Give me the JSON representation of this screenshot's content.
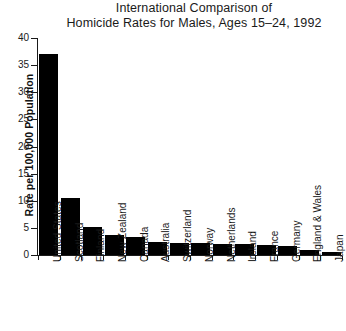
{
  "chart_data": {
    "type": "bar",
    "title": "International Comparison of Homicide Rates for Males, Ages 15–24, 1992",
    "title_lines": [
      "International Comparison of",
      "Homicide Rates for Males, Ages 15–24, 1992"
    ],
    "xlabel": "",
    "ylabel": "Rate per 100,000 Population",
    "ylim": [
      0,
      40
    ],
    "ytick_values": [
      0,
      5,
      10,
      15,
      20,
      25,
      30,
      35,
      40
    ],
    "ytick_labels": [
      "0",
      "5",
      "10",
      "15",
      "20",
      "25",
      "30",
      "35",
      "40"
    ],
    "grid": false,
    "legend": false,
    "bar_color": "#000000",
    "categories": [
      "United States",
      "Scotland",
      "Finland",
      "New Zealand",
      "Canada",
      "Australia",
      "Switzerland",
      "Norway",
      "Netherlands",
      "Ireland",
      "France",
      "Germany",
      "England & Wales",
      "Japan"
    ],
    "values": [
      37.0,
      10.6,
      5.2,
      3.7,
      3.4,
      2.4,
      2.3,
      2.2,
      2.1,
      2.0,
      1.9,
      1.7,
      0.9,
      0.5
    ]
  },
  "margin_note": {
    "lines": [
      "S.",
      "t-",
      "is",
      "or"
    ]
  }
}
